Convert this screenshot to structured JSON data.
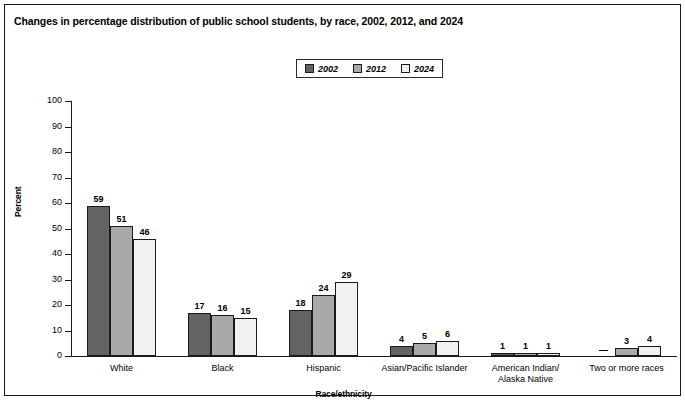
{
  "title": "Changes in percentage distribution of public school students, by race, 2002, 2012, and 2024",
  "axis": {
    "ylabel": "Percent",
    "xlabel": "Race/ethnicity"
  },
  "legend": {
    "items": [
      {
        "label": "2002",
        "color": "#636363"
      },
      {
        "label": "2012",
        "color": "#a9a9a9"
      },
      {
        "label": "2024",
        "color": "#f1f1f1"
      }
    ]
  },
  "yticks": [
    "100",
    "90",
    "80",
    "70",
    "60",
    "50",
    "40",
    "30",
    "20",
    "10",
    "0"
  ],
  "chart_data": {
    "type": "bar",
    "title": "Changes in percentage distribution of public school students, by race, 2002, 2012, and 2024",
    "xlabel": "Race/ethnicity",
    "ylabel": "Percent",
    "ylim": [
      0,
      100
    ],
    "ytick_step": 10,
    "grid": false,
    "legend_position": "top-center",
    "categories": [
      "White",
      "Black",
      "Hispanic",
      "Asian/Pacific Islander",
      "American Indian/\nAlaska Native",
      "Two or more races"
    ],
    "series": [
      {
        "name": "2002",
        "color": "#636363",
        "values": [
          59,
          17,
          18,
          4,
          1,
          null
        ],
        "labels": [
          "59",
          "17",
          "18",
          "4",
          "1",
          "—"
        ]
      },
      {
        "name": "2012",
        "color": "#a9a9a9",
        "values": [
          51,
          16,
          24,
          5,
          1,
          3
        ],
        "labels": [
          "51",
          "16",
          "24",
          "5",
          "1",
          "3"
        ]
      },
      {
        "name": "2024",
        "color": "#f1f1f1",
        "values": [
          46,
          15,
          29,
          6,
          1,
          4
        ],
        "labels": [
          "46",
          "15",
          "29",
          "6",
          "1",
          "4"
        ]
      }
    ]
  }
}
